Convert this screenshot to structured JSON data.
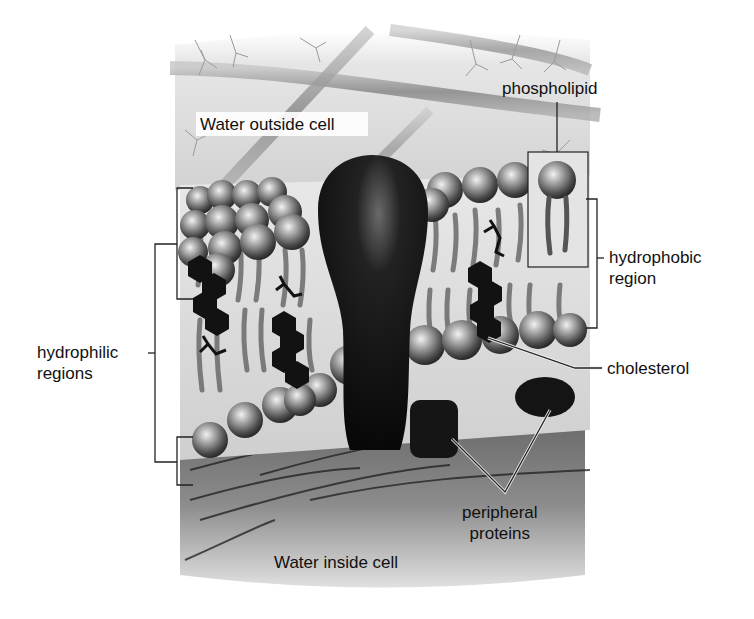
{
  "figure": {
    "colors": {
      "background": "#ffffff",
      "water_outside": "#d9d9d9",
      "water_inside": "#8a8a8a",
      "phospholipid_head": "#9a9a9a",
      "protein": "#141414",
      "cholesterol": "#1a1a1a",
      "label_text": "#111111",
      "leader_line": "#222222"
    }
  },
  "labels": {
    "water_outside": "Water outside cell",
    "phospholipid": "phospholipid",
    "hydrophobic_region": "hydrophobic\nregion",
    "hydrophilic_regions": "hydrophilic\nregions",
    "cholesterol": "cholesterol",
    "peripheral_proteins": "peripheral\nproteins",
    "water_inside": "Water inside cell"
  }
}
